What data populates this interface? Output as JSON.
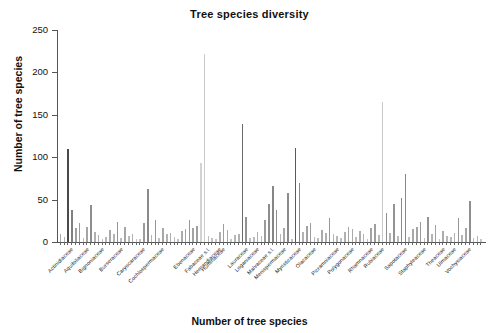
{
  "chart_data": {
    "type": "bar",
    "title": "Tree species diversity",
    "xlabel": "Number of tree species",
    "ylabel": "Number of tree species",
    "ylim": [
      0,
      250
    ],
    "yticks": [
      0,
      50,
      100,
      150,
      200,
      250
    ],
    "grid": false,
    "legend": null,
    "tick_label_rotation": -45,
    "categories": [
      "Acanthaceae",
      "Achariaceae",
      "Actinidiaceae",
      "Anacardiaceae",
      "Annonaceae",
      "Apocynaceae",
      "Aquifoliaceae",
      "Araliaceae",
      "Arecaceae",
      "Asteraceae",
      "Bignoniaceae",
      "Bixaceae",
      "Bonnetiaceae",
      "Boraginaceae",
      "Brunelliaceae",
      "Burseraceae",
      "Cactaceae",
      "Calophyllaceae",
      "Cannabaceae",
      "Capparaceae",
      "Caricaceae",
      "Caryocaraceae",
      "Celastraceae",
      "Chrysobalanaceae",
      "Clethraceae",
      "Clusiaceae",
      "Cochlospermaceae",
      "Combretaceae",
      "Connaraceae",
      "Cordiaceae",
      "Cunoniaceae",
      "Cyrillaceae",
      "Dichapetalaceae",
      "Dilleniaceae",
      "Ebenaceae",
      "Elaeocarpaceae",
      "Erythroxylaceae",
      "Euphorbiaceae",
      "Fabaceae s.l.",
      "Gentianaceae",
      "Goupiaceae",
      "Hernandiaceae",
      "Humiriaceae",
      "Hypericaceae",
      "Icacinaceae",
      "Juglandaceae",
      "Lacistemataceae",
      "Lamiaceae",
      "Lauraceae",
      "Lecythidaceae",
      "Linaceae",
      "Loganiaceae",
      "Lythraceae",
      "Magnoliaceae",
      "Malpighiaceae",
      "Malvaceae s.l.",
      "Melastomataceae",
      "Meliaceae",
      "Menispermaceae",
      "Monimiaceae",
      "Moraceae",
      "Muntingiaceae",
      "Myristicaceae",
      "Myrtaceae",
      "Nyctaginaceae",
      "Ochnaceae",
      "Olacaceae",
      "Oleaceae",
      "Opiliaceae",
      "Pentaphylacaceae",
      "Peraceae",
      "Phyllanthaceae",
      "Picramniaceae",
      "Piperaceae",
      "Podocarpaceae",
      "Polygalaceae",
      "Polygonaceae",
      "Primulaceae",
      "Proteaceae",
      "Putranjivaceae",
      "Quiinaceae",
      "Rhabdodendraceae",
      "Rhamnaceae",
      "Rhizophoraceae",
      "Rosaceae",
      "Rubiaceae",
      "Rutaceae",
      "Sabiaceae",
      "Salicaceae",
      "Santalaceae",
      "Sapindaceae",
      "Sapotaceae",
      "Schoepfiaceae",
      "Simaroubaceae",
      "Siparunaceae",
      "Solanaceae",
      "Staphyleaceae",
      "Sterculiaceae",
      "Styracaceae",
      "Symplocaceae",
      "Tapisciaceae",
      "Theaceae",
      "Thymelaeaceae",
      "Trigoniaceae",
      "Ulmaceae",
      "Urticaceae",
      "Verbenaceae",
      "Violaceae",
      "Vochysiaceae",
      "Winteraceae",
      "Ximeniaceae",
      "Zygophyllaceae"
    ],
    "values": [
      9,
      6,
      110,
      38,
      17,
      23,
      5,
      18,
      44,
      12,
      8,
      4,
      6,
      14,
      10,
      24,
      5,
      18,
      7,
      9,
      4,
      3,
      22,
      62,
      8,
      26,
      5,
      16,
      9,
      11,
      6,
      4,
      13,
      15,
      26,
      17,
      19,
      93,
      222,
      7,
      5,
      4,
      12,
      21,
      14,
      3,
      8,
      10,
      139,
      30,
      5,
      6,
      12,
      7,
      26,
      45,
      66,
      38,
      9,
      16,
      58,
      4,
      111,
      70,
      12,
      19,
      22,
      6,
      5,
      14,
      11,
      28,
      9,
      7,
      5,
      12,
      18,
      15,
      6,
      13,
      10,
      4,
      17,
      21,
      8,
      165,
      34,
      11,
      45,
      7,
      52,
      80,
      6,
      15,
      18,
      24,
      5,
      30,
      9,
      20,
      4,
      13,
      7,
      6,
      11,
      28,
      8,
      17,
      48,
      5,
      7,
      3
    ],
    "bar_shades": [
      "#a8a8a8",
      "#b4b4b4",
      "#4a4a4a",
      "#808080",
      "#a0a0a0",
      "#999999",
      "#bdbdbd",
      "#a5a5a5",
      "#8e8e8e",
      "#b0b0b0",
      "#aeaeae",
      "#c0c0c0",
      "#b8b8b8",
      "#a9a9a9",
      "#b2b2b2",
      "#949494",
      "#bdbdbd",
      "#a6a6a6",
      "#bababa",
      "#b1b1b1",
      "#c2c2c2",
      "#c4c4c4",
      "#9b9b9b",
      "#8a8a8a",
      "#b5b5b5",
      "#969696",
      "#bfbfbf",
      "#a7a7a7",
      "#b3b3b3",
      "#aeaeae",
      "#bcbcbc",
      "#c3c3c3",
      "#ababab",
      "#a4a4a4",
      "#979797",
      "#a3a3a3",
      "#9f9f9f",
      "#d2d2d2",
      "#cbcbcb",
      "#bbbbbb",
      "#c1c1c1",
      "#c4c4c4",
      "#b0b0b0",
      "#9d9d9d",
      "#aaaaaa",
      "#c6c6c6",
      "#b6b6b6",
      "#b2b2b2",
      "#6b6b6b",
      "#929292",
      "#bfbfbf",
      "#bcbcbc",
      "#b1b1b1",
      "#b9b9b9",
      "#9a9a9a",
      "#8d8d8d",
      "#868686",
      "#8f8f8f",
      "#b4b4b4",
      "#a8a8a8",
      "#8b8b8b",
      "#c2c2c2",
      "#5a5a5a",
      "#858585",
      "#b2b2b2",
      "#a2a2a2",
      "#9c9c9c",
      "#bababa",
      "#bdbdbd",
      "#aaaaaa",
      "#b0b0b0",
      "#969696",
      "#b3b3b3",
      "#b8b8b8",
      "#bebebe",
      "#b1b1b1",
      "#a4a4a4",
      "#a9a9a9",
      "#bcbcbc",
      "#aeaeae",
      "#b4b4b4",
      "#c3c3c3",
      "#a3a3a3",
      "#9e9e9e",
      "#b6b6b6",
      "#c9c9c9",
      "#8f8f8f",
      "#b2b2b2",
      "#949494",
      "#bbbbbb",
      "#8c8c8c",
      "#888888",
      "#bcbcbc",
      "#a8a8a8",
      "#a5a5a5",
      "#9a9a9a",
      "#bfbfbf",
      "#929292",
      "#b3b3b3",
      "#a1a1a1",
      "#c2c2c2",
      "#acacac",
      "#b7b7b7",
      "#bababa",
      "#b0b0b0",
      "#969696",
      "#b5b5b5",
      "#a6a6a6",
      "#8f8f8f",
      "#bdbdbd",
      "#b8b8b8",
      "#c5c5c5"
    ],
    "visible_tick_labels": [
      "Actinidiaceae",
      "Aquifoliaceae",
      "Bignoniaceae",
      "Burseraceae",
      "Caryocaraceae",
      "Cochlospermaceae",
      "Ebenaceae",
      "Fabaceae s.l.",
      "Hernandiaceae",
      "Humiriaceae",
      "Lauraceae",
      "Loganiaceae",
      "Malvaceae s.l.",
      "Menispermaceae",
      "Myristicaceae",
      "Olacaceae",
      "Picramniaceae",
      "Polygonaceae",
      "Rhamnaceae",
      "Rubiaceae",
      "Sapotaceae",
      "Staphyleaceae",
      "Theaceae",
      "Ulmaceae",
      "Vochysiaceae"
    ],
    "visible_tick_indices": [
      2,
      6,
      10,
      15,
      21,
      26,
      34,
      38,
      41,
      42,
      48,
      51,
      55,
      58,
      62,
      66,
      72,
      76,
      81,
      84,
      90,
      95,
      100,
      103,
      107
    ],
    "colors": {
      "axis": "#555555",
      "text": "#111111",
      "background": "#ffffff",
      "bar_default": "#9a9a9a"
    }
  }
}
